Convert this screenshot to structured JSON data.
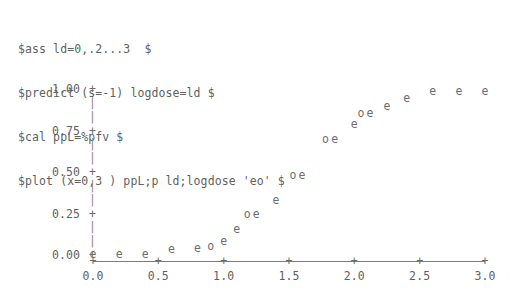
{
  "terminal": {
    "commands": [
      "$ass ld=0,.2...3  $",
      "$predict (s=-1) logdose=ld $",
      "$cal ppL=%pfv $",
      "$plot (x=0,3 ) ppL;p ld;logdose 'eo' $"
    ]
  },
  "chart_data": {
    "type": "scatter",
    "title": "",
    "xlabel": "",
    "ylabel": "",
    "xlim": [
      0.0,
      3.0
    ],
    "ylim": [
      0.0,
      1.0
    ],
    "grid": false,
    "legend": "none",
    "x_ticklabels": [
      "0.0",
      "0.5",
      "1.0",
      "1.5",
      "2.0",
      "2.5",
      "3.0"
    ],
    "x_tickvalues": [
      0.0,
      0.5,
      1.0,
      1.5,
      2.0,
      2.5,
      3.0
    ],
    "y_ticklabels": [
      "0.00",
      "0.25",
      "0.50",
      "0.75",
      "1.00"
    ],
    "y_tickvalues": [
      0.0,
      0.25,
      0.5,
      0.75,
      1.0
    ],
    "tick_glyph": "+",
    "yaxis_glyph": "|",
    "series": [
      {
        "name": "ppL",
        "marker": "e",
        "points": [
          {
            "x": 0.0,
            "y": 0.005
          },
          {
            "x": 0.2,
            "y": 0.005
          },
          {
            "x": 0.4,
            "y": 0.005
          },
          {
            "x": 0.6,
            "y": 0.035
          },
          {
            "x": 0.8,
            "y": 0.045
          },
          {
            "x": 1.0,
            "y": 0.085
          },
          {
            "x": 1.1,
            "y": 0.155
          },
          {
            "x": 1.25,
            "y": 0.245
          },
          {
            "x": 1.4,
            "y": 0.33
          },
          {
            "x": 1.6,
            "y": 0.48
          },
          {
            "x": 1.85,
            "y": 0.7
          },
          {
            "x": 2.0,
            "y": 0.79
          },
          {
            "x": 2.12,
            "y": 0.855
          },
          {
            "x": 2.25,
            "y": 0.9
          },
          {
            "x": 2.4,
            "y": 0.945
          },
          {
            "x": 2.6,
            "y": 0.985
          },
          {
            "x": 2.8,
            "y": 0.985
          },
          {
            "x": 3.0,
            "y": 0.985
          }
        ]
      },
      {
        "name": "p",
        "marker": "o",
        "points": [
          {
            "x": 0.9,
            "y": 0.055
          },
          {
            "x": 1.18,
            "y": 0.245
          },
          {
            "x": 1.53,
            "y": 0.48
          },
          {
            "x": 1.78,
            "y": 0.7
          },
          {
            "x": 2.05,
            "y": 0.855
          }
        ]
      }
    ]
  }
}
